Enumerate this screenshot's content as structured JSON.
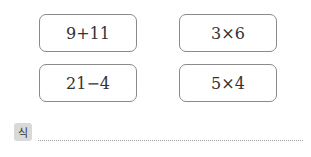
{
  "expressions": [
    {
      "text": "9+11"
    },
    {
      "text": "3×6"
    },
    {
      "text": "21−4"
    },
    {
      "text": "5×4"
    }
  ],
  "answer": {
    "label": "식",
    "value": ""
  }
}
